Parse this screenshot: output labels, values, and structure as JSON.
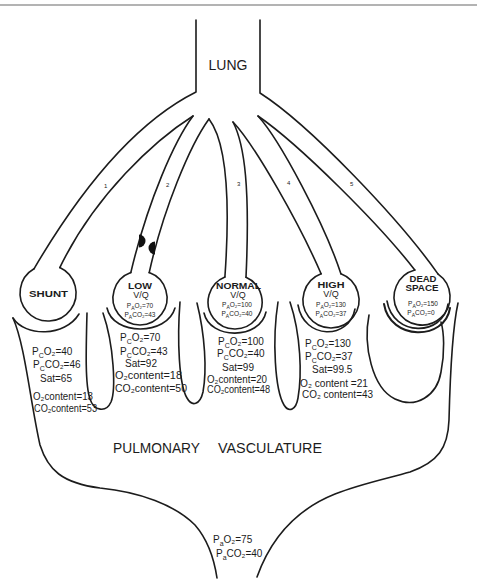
{
  "lung": {
    "label": "LUNG"
  },
  "vasculature": {
    "label_words": [
      "PULMONARY",
      "VASCULATURE"
    ]
  },
  "branches": [
    {
      "label": "1"
    },
    {
      "label": "2"
    },
    {
      "label": "3"
    },
    {
      "label": "4"
    },
    {
      "label": "5"
    }
  ],
  "alveoli": [
    {
      "title": [
        "SHUNT"
      ],
      "capillary": {
        "pressures": [
          {
            "symbol": "P",
            "site": "C",
            "rest": "O₂=40"
          },
          {
            "symbol": "P",
            "site": "C",
            "rest": "CO₂=46"
          }
        ],
        "sat": "Sat=65",
        "o2_content": "O₂content=13",
        "co2_content": "CO₂content=53"
      }
    },
    {
      "title": [
        "LOW"
      ],
      "ratio": "V/Q",
      "alveolar": [
        {
          "symbol": "P",
          "site": "A",
          "rest": "O₂=70"
        },
        {
          "symbol": "P",
          "site": "A",
          "rest": "CO₂=43"
        }
      ],
      "capillary": {
        "pressures": [
          {
            "symbol": "P",
            "site": "C",
            "rest": "O₂=70"
          },
          {
            "symbol": "P",
            "site": "C",
            "rest": "CO₂=43"
          }
        ],
        "sat": "Sat=92",
        "o2_content": "O₂content=18",
        "co2_content": "CO₂content=50"
      }
    },
    {
      "title": [
        "NORMAL"
      ],
      "ratio": "V/Q",
      "alveolar": [
        {
          "symbol": "P",
          "site": "A",
          "rest": "O₂=100"
        },
        {
          "symbol": "P",
          "site": "A",
          "rest": "CO₂=40"
        }
      ],
      "capillary": {
        "pressures": [
          {
            "symbol": "P",
            "site": "C",
            "rest": "O₂=100"
          },
          {
            "symbol": "P",
            "site": "C",
            "rest": "CO₂=40"
          }
        ],
        "sat": "Sat=99",
        "o2_content": "O₂content=20",
        "co2_content": "CO₂content=48"
      }
    },
    {
      "title": [
        "HIGH"
      ],
      "ratio": "V/Q",
      "alveolar": [
        {
          "symbol": "P",
          "site": "A",
          "rest": "O₂=130"
        },
        {
          "symbol": "P",
          "site": "A",
          "rest": "CO₂=37"
        }
      ],
      "capillary": {
        "pressures": [
          {
            "symbol": "P",
            "site": "C",
            "rest": "O₂=130"
          },
          {
            "symbol": "P",
            "site": "C",
            "rest": "CO₂=37"
          }
        ],
        "sat": "Sat=99.5",
        "o2_content": "O₂ content =21",
        "co2_content": "CO₂ content=43"
      }
    },
    {
      "title": [
        "DEAD",
        "SPACE"
      ],
      "alveolar": [
        {
          "symbol": "P",
          "site": "A",
          "rest": "O₂=150"
        },
        {
          "symbol": "P",
          "site": "A",
          "rest": "CO₂=0"
        }
      ]
    }
  ],
  "arterial": [
    {
      "symbol": "P",
      "site": "a",
      "rest": "O₂=75"
    },
    {
      "symbol": "P",
      "site": "a",
      "rest": "CO₂=40"
    }
  ],
  "colors": {
    "ink": "#1c1c1c",
    "background": "#ffffff",
    "top_rule": "#9a9a9a",
    "airway_obstruction": "#111111"
  }
}
